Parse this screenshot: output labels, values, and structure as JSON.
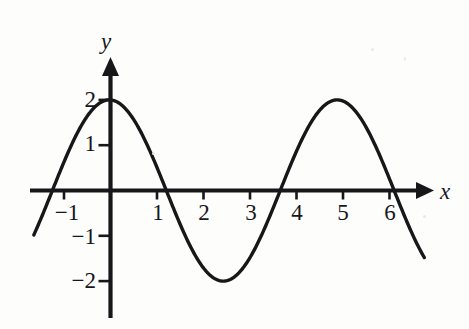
{
  "figure": {
    "background_color": "#fdfdfc",
    "ink_color": "#17171a",
    "width": 469,
    "height": 329
  },
  "axes": {
    "x_axis_label": "x",
    "y_axis_label": "y",
    "x_tick_labels": [
      "−1",
      "1",
      "2",
      "3",
      "4",
      "5",
      "6"
    ],
    "y_tick_labels": [
      "2",
      "1",
      "−1",
      "−2"
    ]
  },
  "chart_data": {
    "type": "line",
    "title": "",
    "xlabel": "x",
    "ylabel": "y",
    "grid": false,
    "legend": false,
    "xlim": [
      -1.7,
      6.8
    ],
    "ylim": [
      -2.95,
      2.95
    ],
    "xticks": [
      -1,
      1,
      2,
      3,
      4,
      5,
      6
    ],
    "xtick_labels": [
      "−1",
      "1",
      "2",
      "3",
      "4",
      "5",
      "6"
    ],
    "yticks": [
      2,
      1,
      -1,
      -2
    ],
    "ytick_labels": [
      "2",
      "1",
      "−1",
      "−2"
    ],
    "series": [
      {
        "name": "y = 2 sin(1.28(x + 1.25))",
        "amplitude": 2,
        "period": 4.9,
        "x_intercepts": [
          -1.25,
          2.2,
          5.5
        ],
        "maximum": {
          "x": 0.73,
          "y": 2
        },
        "minimum": {
          "x": 3.97,
          "y": -2
        },
        "y_intercept": 1.77,
        "x_start": -1.65,
        "x_end": 6.75,
        "x": [
          -1.65,
          -1.45,
          -1.25,
          -1.05,
          -0.85,
          -0.65,
          -0.45,
          -0.25,
          -0.05,
          0.15,
          0.35,
          0.55,
          0.73,
          0.95,
          1.15,
          1.35,
          1.55,
          1.75,
          1.95,
          2.2,
          2.4,
          2.6,
          2.8,
          3.0,
          3.2,
          3.4,
          3.6,
          3.8,
          3.97,
          4.2,
          4.4,
          4.6,
          4.8,
          5.0,
          5.2,
          5.5,
          5.7,
          5.9,
          6.1,
          6.3,
          6.5,
          6.75
        ],
        "y": [
          -0.96,
          -0.49,
          0.0,
          0.5,
          0.96,
          1.34,
          1.64,
          1.85,
          1.96,
          2.0,
          1.97,
          1.9,
          2.0,
          1.73,
          1.5,
          1.23,
          0.9,
          0.54,
          0.16,
          -0.32,
          -0.74,
          -1.1,
          -1.42,
          -1.66,
          -1.84,
          -1.95,
          -2.0,
          -1.99,
          -2.0,
          -1.85,
          -1.66,
          -1.42,
          -1.1,
          -0.74,
          -0.37,
          0.0,
          0.44,
          0.82,
          1.17,
          1.48,
          1.72,
          1.95
        ]
      }
    ]
  }
}
